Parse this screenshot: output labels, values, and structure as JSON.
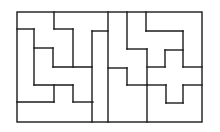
{
  "diagram": {
    "type": "tiling-puzzle",
    "background": "#ffffff",
    "stroke_color": "#1a1a1a",
    "outer_frame": {
      "x": 17,
      "y": 12,
      "width": 185,
      "height": 110
    },
    "segments": [
      [
        54,
        12,
        54,
        29
      ],
      [
        54,
        29,
        73,
        29
      ],
      [
        73,
        29,
        73,
        67
      ],
      [
        17,
        29,
        34,
        29
      ],
      [
        34,
        29,
        34,
        85
      ],
      [
        34,
        48,
        53,
        48
      ],
      [
        53,
        48,
        53,
        67
      ],
      [
        53,
        67,
        92,
        67
      ],
      [
        34,
        85,
        73,
        85
      ],
      [
        54,
        85,
        54,
        102
      ],
      [
        17,
        102,
        54,
        102
      ],
      [
        73,
        85,
        73,
        102
      ],
      [
        73,
        102,
        93,
        102
      ],
      [
        92,
        31,
        92,
        122
      ],
      [
        92,
        31,
        108,
        31
      ],
      [
        108,
        12,
        108,
        122
      ],
      [
        127,
        12,
        127,
        49
      ],
      [
        127,
        49,
        147,
        49
      ],
      [
        147,
        49,
        147,
        122
      ],
      [
        108,
        68,
        127,
        68
      ],
      [
        127,
        68,
        127,
        85
      ],
      [
        127,
        85,
        147,
        85
      ],
      [
        146,
        12,
        146,
        31
      ],
      [
        146,
        31,
        183,
        31
      ],
      [
        183,
        31,
        183,
        67
      ],
      [
        183,
        67,
        202,
        67
      ],
      [
        165,
        50,
        183,
        50
      ],
      [
        165,
        50,
        165,
        67
      ],
      [
        147,
        67,
        165,
        67
      ],
      [
        147,
        85,
        166,
        85
      ],
      [
        166,
        85,
        166,
        103
      ],
      [
        166,
        103,
        183,
        103
      ],
      [
        183,
        103,
        183,
        85
      ],
      [
        183,
        85,
        202,
        85
      ]
    ]
  }
}
